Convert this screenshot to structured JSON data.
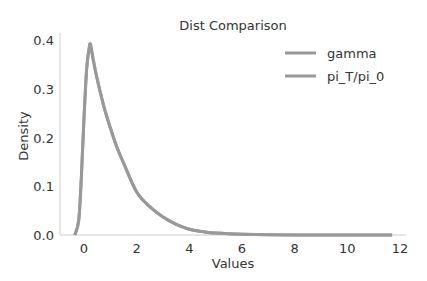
{
  "chart_data": {
    "type": "line",
    "title": "Dist Comparison",
    "xlabel": "Values",
    "ylabel": "Density",
    "xlim": [
      -1.0,
      12.2
    ],
    "ylim": [
      0.0,
      0.41
    ],
    "xticks": [
      0,
      2,
      4,
      6,
      8,
      10,
      12
    ],
    "xtick_labels": [
      "0",
      "2",
      "4",
      "6",
      "8",
      "10",
      "12"
    ],
    "yticks": [
      0.0,
      0.1,
      0.2,
      0.3,
      0.4
    ],
    "ytick_labels": [
      "0.0",
      "0.1",
      "0.2",
      "0.3",
      "0.4"
    ],
    "grid": false,
    "legend_position": "upper right",
    "x": [
      -0.35,
      -0.2,
      -0.1,
      0.0,
      0.1,
      0.2,
      0.25,
      0.35,
      0.5,
      0.75,
      1.0,
      1.25,
      1.5,
      2.0,
      2.5,
      3.0,
      3.5,
      4.0,
      4.5,
      5.0,
      6.0,
      7.0,
      8.0,
      9.0,
      10.0,
      11.0,
      11.7
    ],
    "series": [
      {
        "name": "gamma",
        "color": "#999999",
        "values": [
          0.0,
          0.03,
          0.12,
          0.24,
          0.34,
          0.385,
          0.39,
          0.36,
          0.32,
          0.265,
          0.22,
          0.18,
          0.148,
          0.088,
          0.058,
          0.037,
          0.022,
          0.012,
          0.007,
          0.004,
          0.0015,
          0.0006,
          0.0002,
          0.0001,
          0.0,
          0.0,
          0.0
        ]
      },
      {
        "name": "pi_T/pi_0",
        "color": "#999999",
        "values": [
          0.0,
          0.03,
          0.12,
          0.24,
          0.34,
          0.385,
          0.39,
          0.36,
          0.32,
          0.265,
          0.22,
          0.18,
          0.148,
          0.088,
          0.058,
          0.037,
          0.022,
          0.012,
          0.007,
          0.004,
          0.0015,
          0.0006,
          0.0002,
          0.0001,
          0.0,
          0.0,
          0.0
        ]
      }
    ]
  }
}
